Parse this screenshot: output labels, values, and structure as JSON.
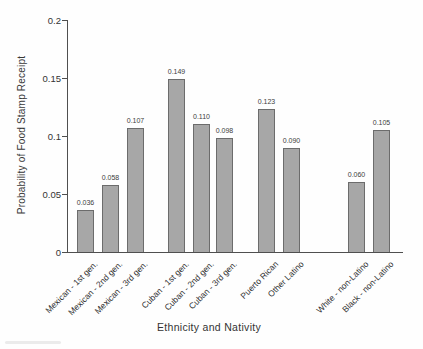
{
  "chart_data": {
    "type": "bar",
    "title": "",
    "xlabel": "Ethnicity and Nativity",
    "ylabel": "Probability of Food Stamp Receipt",
    "categories": [
      "Mexican - 1st gen.",
      "Mexican - 2nd gen.",
      "Mexican - 3rd gen.",
      "Cuban - 1st gen.",
      "Cuban - 2nd gen.",
      "Cuban - 3rd gen.",
      "Puerto Rican",
      "Other Latino",
      "White - non-Latino",
      "Black - non-Latino"
    ],
    "values": [
      0.036,
      0.058,
      0.107,
      0.149,
      0.11,
      0.098,
      0.123,
      0.09,
      0.06,
      0.105
    ],
    "value_labels": [
      "0.036",
      "0.058",
      "0.107",
      "0.149",
      "0.110",
      "0.098",
      "0.123",
      "0.090",
      "0.060",
      "0.105"
    ],
    "ylim": [
      0,
      0.2
    ],
    "ytick_values": [
      0,
      0.05,
      0.1,
      0.15,
      0.2
    ],
    "ytick_labels": [
      "0",
      "0.05",
      "0.1",
      "0.15",
      "0.2"
    ],
    "grid": false,
    "legend": "none",
    "bar_color": "#a7a7a7",
    "bar_border_color": "#6c6c6c",
    "axis_color": "#4f4f4f",
    "text_color": "#3a3a3a"
  }
}
